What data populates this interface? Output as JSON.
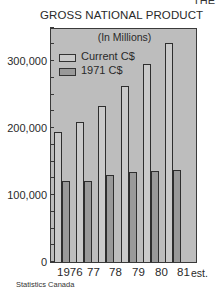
{
  "corner_text": "THE",
  "chart_data": {
    "type": "bar",
    "title": "GROSS NATIONAL PRODUCT",
    "subtitle": "(In Millions)",
    "categories": [
      "1976",
      "77",
      "78",
      "79",
      "80",
      "81 est."
    ],
    "series": [
      {
        "name": "Current C$",
        "color": "#cacaca",
        "values": [
          194000,
          209000,
          233000,
          263000,
          296000,
          327000
        ]
      },
      {
        "name": "1971 C$",
        "color": "#999999",
        "values": [
          121000,
          121000,
          130000,
          134000,
          136000,
          137000
        ]
      }
    ],
    "xlabel": "",
    "ylabel": "",
    "ylim": [
      0,
      350000
    ],
    "yticks": [
      0,
      100000,
      200000,
      300000
    ],
    "ytick_labels": [
      "0",
      "100,000",
      "200,000",
      "300,000"
    ],
    "minor_ticks_every": 25000,
    "legend_position": "upper-left",
    "grid": false,
    "source": "Statistics Canada"
  },
  "labels": {
    "x": [
      "1976",
      "77",
      "78",
      "79",
      "80",
      "81"
    ],
    "x_suffix": "est."
  }
}
